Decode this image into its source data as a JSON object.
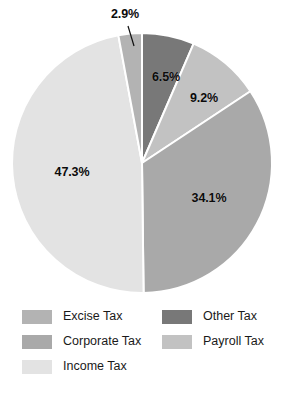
{
  "chart_data": {
    "type": "pie",
    "title": "",
    "subtitle": "",
    "xlabel": "",
    "ylabel": "",
    "grid": false,
    "legend_position": "bottom",
    "units": "percent",
    "total": 100.0,
    "categories": [
      "Other Tax",
      "Payroll Tax",
      "Corporate Tax",
      "Income Tax",
      "Excise Tax"
    ],
    "values": [
      6.5,
      9.2,
      34.1,
      47.3,
      2.9
    ],
    "slices": [
      {
        "label": "Other Tax",
        "value": 6.5,
        "value_text": "6.5%",
        "color": "#787878",
        "start_angle": 0,
        "end_angle": 23.4,
        "label_x": 166,
        "label_y": 77,
        "leader": false
      },
      {
        "label": "Payroll Tax",
        "value": 9.2,
        "value_text": "9.2%",
        "color": "#c2c2c2",
        "start_angle": 23.4,
        "end_angle": 56.5,
        "label_x": 204,
        "label_y": 98,
        "leader": false
      },
      {
        "label": "Corporate Tax",
        "value": 34.1,
        "value_text": "34.1%",
        "color": "#a9a9a9",
        "start_angle": 56.5,
        "end_angle": 179.3,
        "label_x": 209,
        "label_y": 198,
        "leader": false
      },
      {
        "label": "Income Tax",
        "value": 47.3,
        "value_text": "47.3%",
        "color": "#e3e3e3",
        "start_angle": 179.3,
        "end_angle": 349.5,
        "label_x": 72,
        "label_y": 172,
        "leader": false
      },
      {
        "label": "Excise Tax",
        "value": 2.9,
        "value_text": "2.9%",
        "color": "#b3b3b3",
        "start_angle": 349.5,
        "end_angle": 360,
        "label_x": 125,
        "label_y": 14,
        "leader": true,
        "leader_x1": 128,
        "leader_y1": 26,
        "leader_x2": 134,
        "leader_y2": 46
      }
    ],
    "geometry": {
      "center_x": 142,
      "center_y": 163,
      "radius": 130,
      "separator_color": "#ffffff",
      "separator_width": 2
    }
  },
  "legend": {
    "columns": [
      {
        "name": "legend-column-left",
        "items": [
          {
            "label": "Excise Tax",
            "color": "#b3b3b3"
          },
          {
            "label": "Corporate Tax",
            "color": "#a9a9a9"
          },
          {
            "label": "Income Tax",
            "color": "#e3e3e3"
          }
        ]
      },
      {
        "name": "legend-column-right",
        "items": [
          {
            "label": "Other Tax",
            "color": "#787878"
          },
          {
            "label": "Payroll Tax",
            "color": "#c2c2c2"
          }
        ]
      }
    ]
  }
}
